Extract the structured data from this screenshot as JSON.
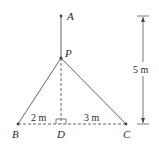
{
  "diagram": {
    "points": {
      "A": {
        "label": "A",
        "x": 61,
        "y": 16
      },
      "P": {
        "label": "P",
        "x": 61,
        "y": 58
      },
      "B": {
        "label": "B",
        "x": 18,
        "y": 124
      },
      "D": {
        "label": "D",
        "x": 61,
        "y": 124
      },
      "C": {
        "label": "C",
        "x": 126,
        "y": 124
      }
    },
    "dimensions": {
      "BD": "2 m",
      "DC": "3 m",
      "height": "5 m"
    },
    "colors": {
      "line": "#555555",
      "text": "#2a2a2a"
    }
  }
}
